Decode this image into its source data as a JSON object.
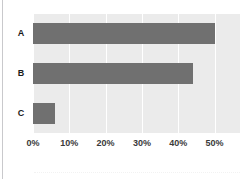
{
  "figure": {
    "watermark_text": "",
    "background_color": "#ffffff",
    "plot_background_color": "#ebebeb",
    "bar_color": "#707070",
    "gridline_color": "#ffffff",
    "label_color": "#1a1a1a",
    "tick_color": "#3a3a3a",
    "left_rule_color": "#c9c9cc"
  },
  "chart_data": {
    "type": "bar",
    "orientation": "horizontal",
    "title": "",
    "subtitle": "",
    "xlabel": "",
    "ylabel": "",
    "categories": [
      "A",
      "B",
      "C"
    ],
    "values": [
      50,
      44,
      6
    ],
    "value_unit": "%",
    "xlim": [
      0,
      57
    ],
    "xticks": [
      0,
      10,
      20,
      30,
      40,
      50
    ],
    "xtick_labels": [
      "0%",
      "10%",
      "20%",
      "30%",
      "40%",
      "50%"
    ],
    "grid": true,
    "grid_axis": "x",
    "legend": false,
    "legend_position": "none",
    "series": [
      {
        "name": "",
        "values": [
          50,
          44,
          6
        ]
      }
    ],
    "annotations": []
  }
}
